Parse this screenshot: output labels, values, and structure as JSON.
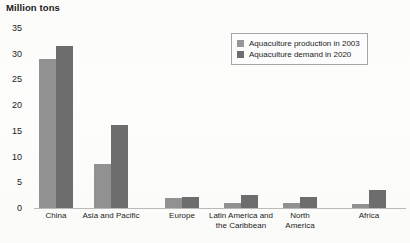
{
  "chart_data": {
    "type": "bar",
    "title": "Million tons",
    "xlabel": "",
    "ylabel": "Million tons",
    "ylim": [
      0,
      35
    ],
    "ytick_labels": [
      "0",
      "5",
      "10",
      "15",
      "20",
      "25",
      "30",
      "35"
    ],
    "yticks": [
      0,
      5,
      10,
      15,
      20,
      25,
      30,
      35
    ],
    "grid": false,
    "legend_position": "top-right",
    "categories": [
      "China",
      "Asia and Pacific",
      "Europe",
      "Latin America and\nthe Caribbean",
      "North\nAmerica",
      "Africa"
    ],
    "series": [
      {
        "name": "Aquaculture production in 2003",
        "color": "#919191",
        "values": [
          29.0,
          8.5,
          2.0,
          1.0,
          1.0,
          0.8
        ]
      },
      {
        "name": "Aquaculture demand in 2020",
        "color": "#6d6d6d",
        "values": [
          31.5,
          16.2,
          2.2,
          2.5,
          2.2,
          3.5
        ]
      }
    ]
  },
  "legend": {
    "entries": [
      {
        "label": "Aquaculture production in 2003",
        "swatch": "light"
      },
      {
        "label": "Aquaculture demand in 2020",
        "swatch": "dark"
      }
    ]
  }
}
